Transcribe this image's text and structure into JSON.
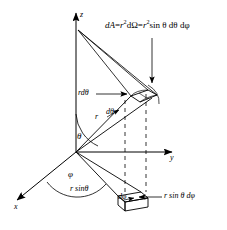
{
  "figure": {
    "background_color": "#ffffff",
    "line_color": "#000000",
    "axes": {
      "z": {
        "label": "z"
      },
      "y": {
        "label": "y"
      },
      "x": {
        "label": "x"
      }
    },
    "angles": {
      "theta": {
        "label": "θ"
      },
      "phi": {
        "label": "φ"
      }
    },
    "equation": {
      "lhs": "dA",
      "eq1": "=",
      "term1_base": "r",
      "term1_exp": "2",
      "term1_tail": "dΩ",
      "eq2": "=",
      "term2_base": "r",
      "term2_exp": "2",
      "term2_tail": "sin θ dθ dφ",
      "full_text": "dA = r2dΩ = r2sin θ dθ dφ"
    },
    "labels": {
      "r_dtheta": "rdθ",
      "r": "r",
      "d_theta_inner": "dθ",
      "r_sin_theta": "r sinθ",
      "d_phi_lower": "dφ",
      "r_sin_theta_d_phi": "r sin θ dφ"
    }
  }
}
